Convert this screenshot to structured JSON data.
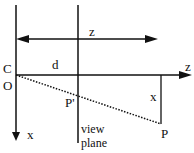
{
  "diagram": {
    "colors": {
      "stroke": "#111111",
      "background": "#ffffff"
    },
    "labels": {
      "top_z": "z",
      "axis_z": "z",
      "c": "C",
      "o": "O",
      "d": "d",
      "p_prime": "P'",
      "p": "P",
      "x_segment": "x",
      "axis_x": "x",
      "view_plane_line1": "view",
      "view_plane_line2": "plane"
    },
    "elements": {
      "x_axis": "vertical axis through origin with downward arrow",
      "view_plane": "vertical line at distance d",
      "z_extent_arrow": "double-headed arrow spanning z",
      "z_axis": "horizontal axis with rightward arrow",
      "projection_ray": "dotted line from O to P through P'",
      "x_offset": "vertical segment from z-axis to P"
    }
  }
}
